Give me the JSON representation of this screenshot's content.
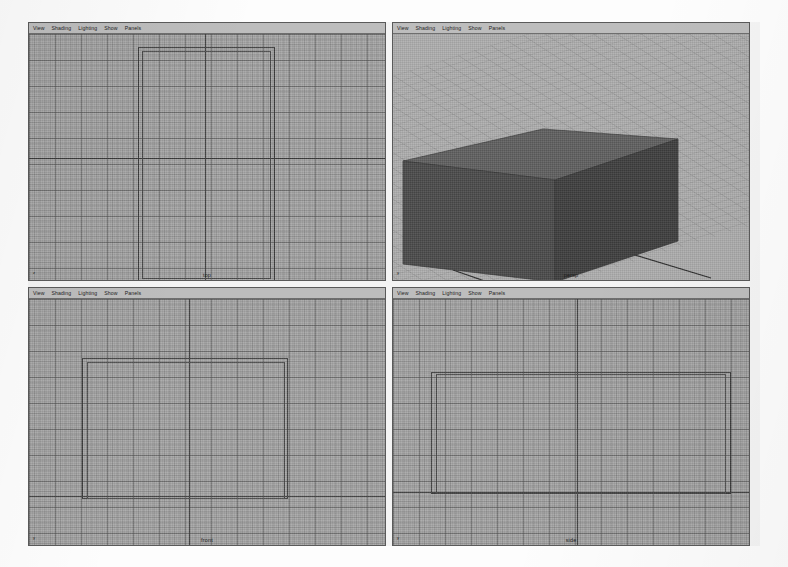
{
  "app": {
    "title": "Maya 4-View Layout",
    "background_color": "#ffffff",
    "viewport_color": "#a6a6a6"
  },
  "menu": {
    "items": [
      "View",
      "Shading",
      "Lighting",
      "Show",
      "Panels"
    ]
  },
  "viewports": [
    {
      "id": "top",
      "label": "top",
      "type": "orthographic-wireframe",
      "axis_indicator": {
        "letter": "z"
      },
      "menu": [
        "View",
        "Shading",
        "Lighting",
        "Show",
        "Panels"
      ]
    },
    {
      "id": "persp",
      "label": "persp",
      "type": "perspective-shaded",
      "axis_indicator": {
        "letter": "y"
      },
      "menu": [
        "View",
        "Shading",
        "Lighting",
        "Show",
        "Panels"
      ]
    },
    {
      "id": "front",
      "label": "front",
      "type": "orthographic-wireframe",
      "axis_indicator": {
        "letter": "y"
      },
      "menu": [
        "View",
        "Shading",
        "Lighting",
        "Show",
        "Panels"
      ]
    },
    {
      "id": "side",
      "label": "side",
      "type": "orthographic-wireframe",
      "axis_indicator": {
        "letter": "y"
      },
      "menu": [
        "View",
        "Shading",
        "Lighting",
        "Show",
        "Panels"
      ]
    }
  ],
  "scene": {
    "object": "polygon-cube",
    "shading_mode": "smooth-shaded",
    "wireframe_color": "#3c3c3c",
    "shaded_face_colors": {
      "top": "#5d5d5d",
      "left": "#474747",
      "right": "#3d3d3d"
    }
  }
}
